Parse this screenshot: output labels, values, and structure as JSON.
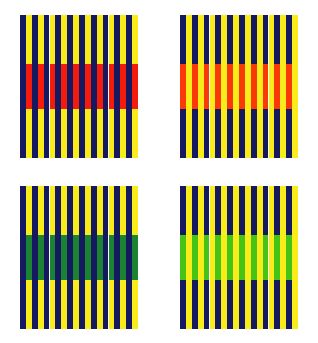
{
  "figure": {
    "canvas": {
      "width": 318,
      "height": 343,
      "background": "#ffffff"
    }
  },
  "palette": {
    "yellow": "#f9ec1b",
    "navy": "#151a60",
    "red": "#f21b0c",
    "orange_red": "#fa3a06",
    "dark_green": "#1a8433",
    "bright_green": "#46c416",
    "white": "#ffffff"
  },
  "stripe_layout": {
    "pair_count": 10,
    "stripes_per_pair": 2,
    "first_stripe_color_key": "navy",
    "second_stripe_color_key": "yellow"
  },
  "panels": [
    {
      "id": "panel-top-left",
      "name": "top-left-panel",
      "label": "Yellow stripes become red",
      "x": 20,
      "y": 15,
      "width": 118,
      "height": 143,
      "band_top_ratio": 0.345,
      "band_bottom_ratio": 0.655,
      "stripe_a_color": "#151a60",
      "stripe_b_color": "#f9ec1b",
      "band_a_color": "#151a60",
      "band_b_color": "#f21b0c",
      "band_description": "Inside the band the yellow stripes are replaced by saturated red while the navy stripes are unchanged."
    },
    {
      "id": "panel-top-right",
      "name": "top-right-panel",
      "label": "Navy stripes become orange-red",
      "x": 180,
      "y": 15,
      "width": 118,
      "height": 143,
      "band_top_ratio": 0.345,
      "band_bottom_ratio": 0.655,
      "stripe_a_color": "#151a60",
      "stripe_b_color": "#f9ec1b",
      "band_a_color": "#fa3a06",
      "band_b_color": "#f9ec1b",
      "band_description": "Inside the band the navy stripes are replaced by orange-red while the yellow stripes are unchanged."
    },
    {
      "id": "panel-bottom-left",
      "name": "bottom-left-panel",
      "label": "Yellow stripes become dark green",
      "x": 20,
      "y": 186,
      "width": 118,
      "height": 143,
      "band_top_ratio": 0.345,
      "band_bottom_ratio": 0.655,
      "stripe_a_color": "#151a60",
      "stripe_b_color": "#f9ec1b",
      "band_a_color": "#151a60",
      "band_b_color": "#1a8433",
      "band_description": "Inside the band the yellow stripes are replaced by dark green while the navy stripes are unchanged."
    },
    {
      "id": "panel-bottom-right",
      "name": "bottom-right-panel",
      "label": "Navy stripes become bright green",
      "x": 180,
      "y": 186,
      "width": 118,
      "height": 143,
      "band_top_ratio": 0.345,
      "band_bottom_ratio": 0.655,
      "stripe_a_color": "#151a60",
      "stripe_b_color": "#f9ec1b",
      "band_a_color": "#46c416",
      "band_b_color": "#f9ec1b",
      "band_description": "Inside the band the navy stripes are replaced by bright green while the yellow stripes are unchanged."
    }
  ]
}
